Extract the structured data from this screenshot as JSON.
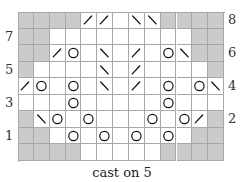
{
  "chart": {
    "caption": "cast on 5",
    "columns": 13,
    "rows_top_to_bottom": [
      {
        "label": "8",
        "side": "right",
        "cells": [
          "S",
          "S",
          "S",
          "S",
          "/",
          "/",
          "",
          "\\",
          "\\",
          "S",
          "S",
          "S",
          "S"
        ]
      },
      {
        "label": "7",
        "side": "left",
        "cells": [
          "S",
          "S",
          "",
          "",
          "",
          "",
          "",
          "",
          "",
          "",
          "",
          "S",
          "S"
        ]
      },
      {
        "label": "6",
        "side": "right",
        "cells": [
          "S",
          "S",
          "/",
          "O",
          "",
          "\\",
          "",
          "/",
          "",
          "O",
          "\\",
          "S",
          "S"
        ]
      },
      {
        "label": "5",
        "side": "left",
        "cells": [
          "S",
          "",
          "",
          "",
          "",
          "\\",
          "",
          "/",
          "",
          "",
          "",
          "",
          "S"
        ]
      },
      {
        "label": "4",
        "side": "right",
        "cells": [
          "/",
          "O",
          "",
          "O",
          "",
          "\\",
          "",
          "/",
          "",
          "O",
          "",
          "O",
          "\\"
        ]
      },
      {
        "label": "3",
        "side": "left",
        "cells": [
          "",
          "",
          "",
          "O",
          "",
          "",
          "",
          "",
          "",
          "O",
          "",
          "",
          ""
        ]
      },
      {
        "label": "2",
        "side": "right",
        "cells": [
          "S",
          "\\",
          "O",
          "",
          "O",
          "",
          "",
          "",
          "O",
          "",
          "O",
          "/",
          "S"
        ]
      },
      {
        "label": "1",
        "side": "left",
        "cells": [
          "S",
          "S",
          "",
          "O",
          "",
          "O",
          "",
          "O",
          "",
          "O",
          "",
          "S",
          "S"
        ]
      },
      {
        "label": "",
        "side": "none",
        "cells": [
          "S",
          "S",
          "S",
          "S",
          "",
          "",
          "",
          "",
          "",
          "S",
          "S",
          "S",
          "S"
        ]
      }
    ],
    "legend_symbols": {
      "S": "no-stitch (shaded)",
      "O": "yarn-over",
      "/": "k2tog (right-slanting decrease)",
      "\\": "ssk (left-slanting decrease)",
      "": "knit"
    },
    "colors": {
      "shaded": "#cbcbcb",
      "grid": "#a8a8a8",
      "symbol": "#111111"
    }
  }
}
